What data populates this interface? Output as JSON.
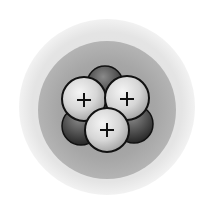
{
  "diagram": {
    "electron_cloud": {
      "outer": {
        "cx": 107,
        "cy": 107,
        "r": 88,
        "color": "#e6e6e6"
      },
      "inner": {
        "cx": 107,
        "cy": 110,
        "r": 69,
        "color": "#a8a8a8"
      }
    },
    "nucleus": {
      "neutrons": [
        {
          "cx": 105,
          "cy": 84,
          "r": 18
        },
        {
          "cx": 81,
          "cy": 126,
          "r": 19
        },
        {
          "cx": 134,
          "cy": 124,
          "r": 19
        }
      ],
      "protons": [
        {
          "cx": 84,
          "cy": 99,
          "r": 22,
          "label": "+"
        },
        {
          "cx": 127,
          "cy": 98,
          "r": 22,
          "label": "+"
        },
        {
          "cx": 107,
          "cy": 130,
          "r": 22,
          "label": "+"
        }
      ],
      "proton_count": 3,
      "neutron_count_visible": 3
    },
    "colors": {
      "background": "#ffffff",
      "proton_fill": "#dcdcdc",
      "neutron_fill": "#5a5a5a",
      "outline": "#111111"
    }
  }
}
